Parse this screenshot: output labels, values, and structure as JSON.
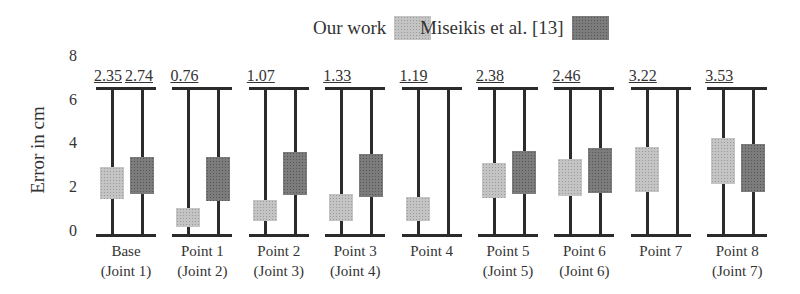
{
  "chart_data": {
    "type": "box",
    "title": "",
    "xlabel": "",
    "ylabel": "Error in cm",
    "ylim": [
      0,
      8
    ],
    "yticks": [
      0,
      2,
      4,
      6,
      8
    ],
    "grid": false,
    "legend_position": "top",
    "legend": [
      {
        "name": "Our work",
        "color": "#c4c4c4"
      },
      {
        "name": "Miseikis et al. [13]",
        "color": "#7c7c7c"
      }
    ],
    "categories": [
      {
        "line1": "Base",
        "line2": "(Joint 1)"
      },
      {
        "line1": "Point 1",
        "line2": "(Joint 2)"
      },
      {
        "line1": "Point 2",
        "line2": "(Joint 3)"
      },
      {
        "line1": "Point 3",
        "line2": "(Joint 4)"
      },
      {
        "line1": "Point 4",
        "line2": ""
      },
      {
        "line1": "Point 5",
        "line2": "(Joint 5)"
      },
      {
        "line1": "Point 6",
        "line2": "(Joint 6)"
      },
      {
        "line1": "Point 7",
        "line2": ""
      },
      {
        "line1": "Point 8",
        "line2": "(Joint 7)"
      }
    ],
    "whisker_range": [
      0,
      6.7
    ],
    "series": [
      {
        "name": "Our work",
        "boxes": [
          {
            "q1": 1.65,
            "q3": 3.1
          },
          {
            "q1": 0.36,
            "q3": 1.23
          },
          {
            "q1": 0.64,
            "q3": 1.6
          },
          {
            "q1": 0.64,
            "q3": 1.87
          },
          {
            "q1": 0.64,
            "q3": 1.73
          },
          {
            "q1": 1.69,
            "q3": 3.29
          },
          {
            "q1": 1.78,
            "q3": 3.47
          },
          {
            "q1": 1.96,
            "q3": 4.02
          },
          {
            "q1": 2.33,
            "q3": 4.43
          }
        ]
      },
      {
        "name": "Miseikis et al. [13]",
        "boxes": [
          {
            "q1": 1.87,
            "q3": 3.56
          },
          {
            "q1": 1.55,
            "q3": 3.56
          },
          {
            "q1": 1.83,
            "q3": 3.79
          },
          {
            "q1": 1.73,
            "q3": 3.7
          },
          null,
          {
            "q1": 1.87,
            "q3": 3.84
          },
          {
            "q1": 1.92,
            "q3": 3.97
          },
          null,
          {
            "q1": 1.96,
            "q3": 4.16
          }
        ]
      }
    ],
    "annotations": [
      [
        "2.35",
        "2.74"
      ],
      [
        "0.76"
      ],
      [
        "1.07"
      ],
      [
        "1.33"
      ],
      [
        "1.19"
      ],
      [
        "2.38"
      ],
      [
        "2.46"
      ],
      [
        "3.22"
      ],
      [
        "3.53"
      ]
    ]
  }
}
